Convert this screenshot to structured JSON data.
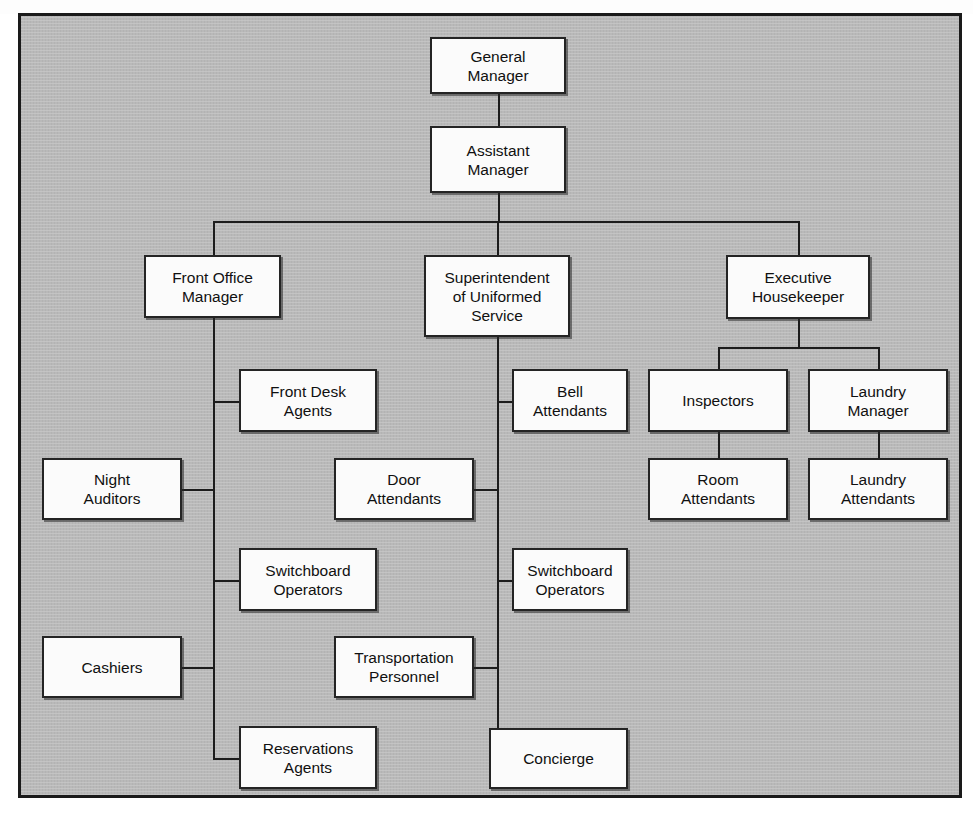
{
  "document": {
    "title": "Hotel Organization Chart",
    "top_cropped_text": "",
    "bottom_cropped_text": ""
  },
  "canvas": {
    "width": 973,
    "height": 819,
    "background_color": "#b9b9b9",
    "frame_color": "#1a1a1a",
    "box_fill": "#fbfbfb",
    "box_border": "#242424",
    "line_color": "#1c1c1c"
  },
  "chart_data": {
    "type": "diagram",
    "subtype": "organization-chart",
    "root": "general-manager",
    "nodes": [
      {
        "id": "general-manager",
        "label": "General\nManager",
        "x": 430,
        "y": 31,
        "w": 136,
        "h": 57,
        "level": 0
      },
      {
        "id": "assistant-manager",
        "label": "Assistant\nManager",
        "x": 430,
        "y": 120,
        "w": 136,
        "h": 67,
        "level": 1
      },
      {
        "id": "front-office-manager",
        "label": "Front Office\nManager",
        "x": 144,
        "y": 249,
        "w": 137,
        "h": 63,
        "level": 2
      },
      {
        "id": "superintendent-uniformed",
        "label": "Superintendent\nof Uniformed\nService",
        "x": 424,
        "y": 249,
        "w": 146,
        "h": 82,
        "level": 2
      },
      {
        "id": "executive-housekeeper",
        "label": "Executive\nHousekeeper",
        "x": 726,
        "y": 249,
        "w": 144,
        "h": 64,
        "level": 2
      },
      {
        "id": "front-desk-agents",
        "label": "Front Desk\nAgents",
        "x": 239,
        "y": 363,
        "w": 138,
        "h": 63,
        "level": 3,
        "parent": "front-office-manager"
      },
      {
        "id": "night-auditors",
        "label": "Night\nAuditors",
        "x": 42,
        "y": 452,
        "w": 140,
        "h": 62,
        "level": 3,
        "parent": "front-office-manager"
      },
      {
        "id": "switchboard-operators-fo",
        "label": "Switchboard\nOperators",
        "x": 239,
        "y": 542,
        "w": 138,
        "h": 63,
        "level": 3,
        "parent": "front-office-manager"
      },
      {
        "id": "cashiers",
        "label": "Cashiers",
        "x": 42,
        "y": 630,
        "w": 140,
        "h": 62,
        "level": 3,
        "parent": "front-office-manager"
      },
      {
        "id": "reservations-agents",
        "label": "Reservations\nAgents",
        "x": 239,
        "y": 720,
        "w": 138,
        "h": 63,
        "level": 3,
        "parent": "front-office-manager"
      },
      {
        "id": "bell-attendants",
        "label": "Bell\nAttendants",
        "x": 512,
        "y": 363,
        "w": 116,
        "h": 63,
        "level": 3,
        "parent": "superintendent-uniformed"
      },
      {
        "id": "door-attendants",
        "label": "Door\nAttendants",
        "x": 334,
        "y": 452,
        "w": 140,
        "h": 62,
        "level": 3,
        "parent": "superintendent-uniformed"
      },
      {
        "id": "switchboard-operators-su",
        "label": "Switchboard\nOperators",
        "x": 512,
        "y": 542,
        "w": 116,
        "h": 63,
        "level": 3,
        "parent": "superintendent-uniformed"
      },
      {
        "id": "transportation-personnel",
        "label": "Transportation\nPersonnel",
        "x": 334,
        "y": 630,
        "w": 140,
        "h": 62,
        "level": 3,
        "parent": "superintendent-uniformed"
      },
      {
        "id": "concierge",
        "label": "Concierge",
        "x": 489,
        "y": 722,
        "w": 139,
        "h": 61,
        "level": 3,
        "parent": "superintendent-uniformed"
      },
      {
        "id": "inspectors",
        "label": "Inspectors",
        "x": 648,
        "y": 363,
        "w": 140,
        "h": 63,
        "level": 3,
        "parent": "executive-housekeeper"
      },
      {
        "id": "laundry-manager",
        "label": "Laundry\nManager",
        "x": 808,
        "y": 363,
        "w": 140,
        "h": 63,
        "level": 3,
        "parent": "executive-housekeeper"
      },
      {
        "id": "room-attendants",
        "label": "Room\nAttendants",
        "x": 648,
        "y": 452,
        "w": 140,
        "h": 62,
        "level": 4,
        "parent": "inspectors"
      },
      {
        "id": "laundry-attendants",
        "label": "Laundry\nAttendants",
        "x": 808,
        "y": 452,
        "w": 140,
        "h": 62,
        "level": 4,
        "parent": "laundry-manager"
      }
    ],
    "edges": [
      {
        "from": "general-manager",
        "to": "assistant-manager"
      },
      {
        "from": "assistant-manager",
        "to": "front-office-manager"
      },
      {
        "from": "assistant-manager",
        "to": "superintendent-uniformed"
      },
      {
        "from": "assistant-manager",
        "to": "executive-housekeeper"
      },
      {
        "from": "front-office-manager",
        "to": "front-desk-agents"
      },
      {
        "from": "front-office-manager",
        "to": "night-auditors"
      },
      {
        "from": "front-office-manager",
        "to": "switchboard-operators-fo"
      },
      {
        "from": "front-office-manager",
        "to": "cashiers"
      },
      {
        "from": "front-office-manager",
        "to": "reservations-agents"
      },
      {
        "from": "superintendent-uniformed",
        "to": "bell-attendants"
      },
      {
        "from": "superintendent-uniformed",
        "to": "door-attendants"
      },
      {
        "from": "superintendent-uniformed",
        "to": "switchboard-operators-su"
      },
      {
        "from": "superintendent-uniformed",
        "to": "transportation-personnel"
      },
      {
        "from": "superintendent-uniformed",
        "to": "concierge"
      },
      {
        "from": "executive-housekeeper",
        "to": "inspectors"
      },
      {
        "from": "executive-housekeeper",
        "to": "laundry-manager"
      },
      {
        "from": "inspectors",
        "to": "room-attendants"
      },
      {
        "from": "laundry-manager",
        "to": "laundry-attendants"
      }
    ]
  }
}
